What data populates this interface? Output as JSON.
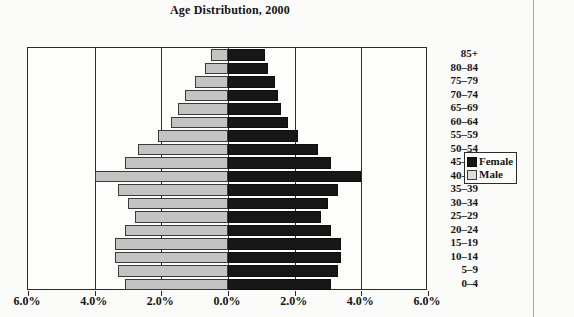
{
  "chart_title": "Age Distribution, 2000",
  "legend": {
    "position": "right",
    "items": [
      {
        "label": "Female",
        "swatch": "female-swatch",
        "color": "#171717"
      },
      {
        "label": "Male",
        "swatch": "male-swatch",
        "color": "#c3c3c3"
      }
    ]
  },
  "x_axis": {
    "tick_labels": [
      "6.0%",
      "4.0%",
      "2.0%",
      "0.0%",
      "2.0%",
      "4.0%",
      "6.0%"
    ],
    "tick_values": [
      -6,
      -4,
      -2,
      0,
      2,
      4,
      6
    ]
  },
  "chart_data": {
    "type": "bar",
    "subtype": "population-pyramid",
    "title": "Age Distribution, 2000",
    "xlabel": "",
    "ylabel": "",
    "xlim": [
      -6,
      6
    ],
    "grid": true,
    "legend_position": "right",
    "orientation": "horizontal",
    "categories": [
      "85+",
      "80-84",
      "75-79",
      "70-74",
      "65-69",
      "60-64",
      "55-59",
      "50-54",
      "45-49",
      "40-44",
      "35-39",
      "30-34",
      "25-29",
      "20-24",
      "15-19",
      "10-14",
      "5-9",
      "0-4"
    ],
    "series": [
      {
        "name": "Male",
        "color": "#c3c3c3",
        "side": "left",
        "values": [
          0.5,
          0.7,
          1.0,
          1.3,
          1.5,
          1.7,
          2.1,
          2.7,
          3.1,
          4.0,
          3.3,
          3.0,
          2.8,
          3.1,
          3.4,
          3.4,
          3.3,
          3.1
        ]
      },
      {
        "name": "Female",
        "color": "#171717",
        "side": "right",
        "values": [
          1.1,
          1.2,
          1.4,
          1.5,
          1.6,
          1.8,
          2.1,
          2.7,
          3.1,
          4.0,
          3.3,
          3.0,
          2.8,
          3.1,
          3.4,
          3.4,
          3.3,
          3.1
        ]
      }
    ]
  }
}
